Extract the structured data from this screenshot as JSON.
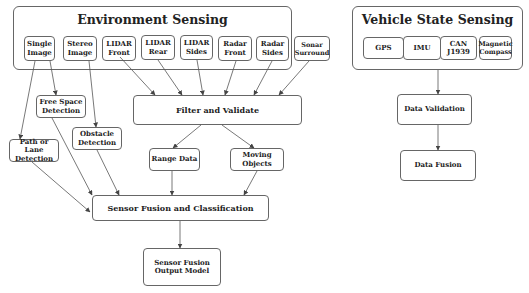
{
  "environment_sensing": {
    "title": "Environment Sensing",
    "sensors": [
      {
        "id": "single-image",
        "label": "Single\nImage"
      },
      {
        "id": "stereo-image",
        "label": "Stereo\nImage"
      },
      {
        "id": "lidar-front",
        "label": "LIDAR\nFront"
      },
      {
        "id": "lidar-rear",
        "label": "LIDAR\nRear"
      },
      {
        "id": "lidar-sides",
        "label": "LIDAR\nSides"
      },
      {
        "id": "radar-front",
        "label": "Radar\nFront"
      },
      {
        "id": "radar-sides",
        "label": "Radar\nSides"
      },
      {
        "id": "sonar-surround",
        "label": "Sonar\nSurround"
      }
    ]
  },
  "vehicle_state_sensing": {
    "title": "Vehicle State Sensing",
    "sensors": [
      {
        "id": "gps",
        "label": "GPS"
      },
      {
        "id": "imu",
        "label": "IMU"
      },
      {
        "id": "can-j1939",
        "label": "CAN\nJ1939"
      },
      {
        "id": "magnetic-compass",
        "label": "Magnetic\nCompass"
      }
    ]
  },
  "processing": {
    "filter_validate": "Filter and Validate",
    "range_data": "Range Data",
    "moving_objects": "Moving Objects",
    "free_space_detection": "Free Space\nDetection",
    "obstacle_detection": "Obstacle\nDetection",
    "path_lane_detection": "Path or Lane\nDetection",
    "sensor_fusion_classification": "Sensor Fusion and Classification",
    "sensor_fusion_output_model": "Sensor Fusion\nOutput Model",
    "data_validation": "Data Validation",
    "data_fusion": "Data Fusion"
  },
  "colors": {
    "border": "#666666",
    "text": "#222222",
    "arrow": "#444444",
    "background": "#ffffff"
  }
}
